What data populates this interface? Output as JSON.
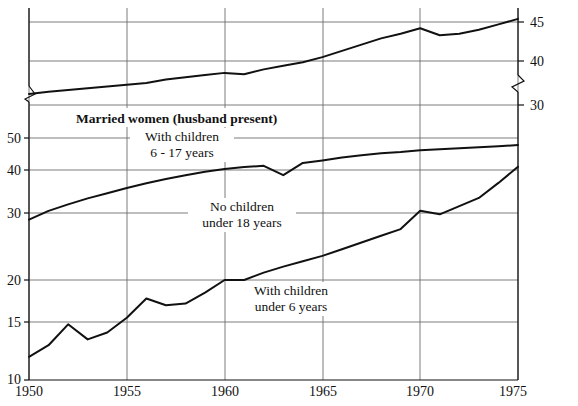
{
  "chart_data": {
    "type": "line",
    "title": "Married women (husband present)",
    "xlabel": "",
    "ylabel": "",
    "grid": true,
    "legend_position": "inline-annotations",
    "axis_note": "Broken (discontinuous) vertical axis: lower panel 10-50 on left, upper panel 30-45 on right",
    "x": [
      1950,
      1951,
      1952,
      1953,
      1954,
      1955,
      1956,
      1957,
      1958,
      1959,
      1960,
      1961,
      1962,
      1963,
      1964,
      1965,
      1966,
      1967,
      1968,
      1969,
      1970,
      1971,
      1972,
      1973,
      1974,
      1975
    ],
    "xlim": [
      1950,
      1975
    ],
    "xticks": [
      "1950",
      "1955",
      "1960",
      "1965",
      "1970",
      "1975"
    ],
    "left_axis": {
      "ticks": [
        "50",
        "40",
        "30",
        "20",
        "15",
        "10"
      ],
      "values": [
        50,
        40,
        30,
        20,
        15,
        10
      ],
      "lim": [
        10,
        50
      ]
    },
    "right_axis": {
      "ticks": [
        "45",
        "40",
        "30"
      ],
      "values": [
        45,
        40,
        30
      ],
      "lim": [
        30,
        45
      ]
    },
    "series": [
      {
        "name": "With children 6 - 17 years",
        "label_line1": "With children",
        "label_line2": "6 - 17 years",
        "axis": "right",
        "values": [
          32.5,
          33.0,
          33.4,
          33.8,
          34.2,
          34.6,
          35.0,
          35.8,
          36.3,
          36.8,
          37.3,
          37.0,
          38.1,
          38.9,
          39.7,
          40.5,
          41.3,
          42.1,
          42.9,
          43.5,
          44.2,
          43.3,
          43.5,
          44.0,
          44.7,
          45.4
        ]
      },
      {
        "name": "No children under 18 years",
        "label_line1": "No children",
        "label_line2": "under 18 years",
        "axis": "left",
        "values": [
          29.0,
          30.5,
          32.0,
          33.4,
          34.6,
          35.8,
          36.9,
          37.9,
          38.8,
          39.6,
          40.3,
          40.9,
          41.3,
          38.8,
          42.2,
          43.0,
          43.9,
          44.6,
          45.2,
          45.6,
          46.2,
          46.5,
          46.8,
          47.1,
          47.4,
          47.8
        ]
      },
      {
        "name": "With children under 6 years",
        "label_line1": "With children",
        "label_line2": "under 6 years",
        "axis": "left",
        "values": [
          12.0,
          13.0,
          14.8,
          13.5,
          14.1,
          15.5,
          17.8,
          17.0,
          17.2,
          18.5,
          20.0,
          20.0,
          21.1,
          22.0,
          22.8,
          23.6,
          24.6,
          25.6,
          26.6,
          27.6,
          30.5,
          29.8,
          31.6,
          33.5,
          37.0,
          41.0
        ]
      }
    ],
    "annotations": [
      {
        "id": "title",
        "text": "Married women (husband present)"
      },
      {
        "id": "series1",
        "l1": "With children",
        "l2": "6 - 17 years"
      },
      {
        "id": "series2",
        "l1": "No children",
        "l2": "under 18 years"
      },
      {
        "id": "series3",
        "l1": "With children",
        "l2": "under 6 years"
      }
    ]
  }
}
